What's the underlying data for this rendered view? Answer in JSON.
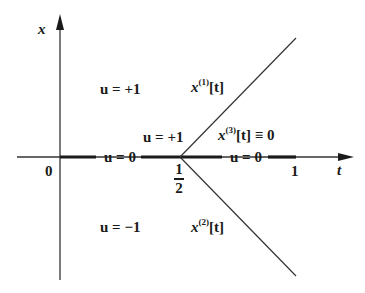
{
  "diagram": {
    "type": "phase-plane / switching diagram",
    "axes": {
      "horizontal_label": "t",
      "vertical_label": "x",
      "origin_label": "0",
      "tick_half_num": "1",
      "tick_half_den": "2",
      "tick_one": "1"
    },
    "regions": {
      "upper_left": "u = +1",
      "upper_center": "u = +1",
      "lower_left": "u = −1",
      "axis_left": "u = 0",
      "axis_right": "u = 0"
    },
    "trajectories": {
      "x1": {
        "base": "x",
        "sup": "(1)",
        "arg": "[t]"
      },
      "x2": {
        "base": "x",
        "sup": "(2)",
        "arg": "[t]"
      },
      "x3": {
        "base": "x",
        "sup": "(3)",
        "arg": "[t] ≡ 0"
      }
    },
    "colors": {
      "ink": "#1a1a1a",
      "thin_line": "#333333",
      "background": "#ffffff"
    }
  }
}
